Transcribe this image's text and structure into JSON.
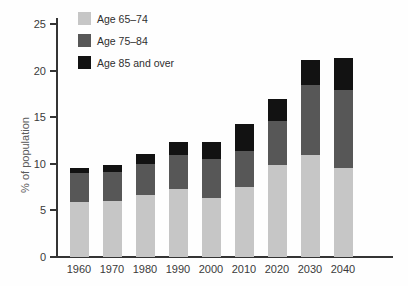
{
  "figure": {
    "ylabel": "% of population"
  },
  "chart_data": {
    "type": "bar",
    "stacked": true,
    "title": "",
    "xlabel": "",
    "ylabel": "% of population",
    "ylim": [
      0,
      25
    ],
    "yticks": [
      "0",
      "5",
      "10",
      "15",
      "20",
      "25"
    ],
    "grid": false,
    "legend_position": "top-left-inside",
    "categories": [
      "1960",
      "1970",
      "1980",
      "1990",
      "2000",
      "2010",
      "2020",
      "2030",
      "2040"
    ],
    "series": [
      {
        "name": "Age 65–74",
        "color": "#c6c6c6",
        "values": [
          5.9,
          6.0,
          6.6,
          7.3,
          6.3,
          7.5,
          9.9,
          10.9,
          9.6
        ]
      },
      {
        "name": "Age 75–84",
        "color": "#575757",
        "values": [
          3.1,
          3.1,
          3.4,
          3.6,
          4.2,
          3.9,
          4.7,
          7.6,
          8.3
        ]
      },
      {
        "name": "Age 85 and over",
        "color": "#121212",
        "values": [
          0.5,
          0.8,
          1.1,
          1.4,
          1.8,
          2.9,
          2.4,
          2.6,
          3.4
        ]
      }
    ],
    "totals": [
      9.5,
      9.9,
      11.1,
      12.3,
      12.3,
      14.3,
      17.0,
      21.1,
      21.3
    ]
  }
}
